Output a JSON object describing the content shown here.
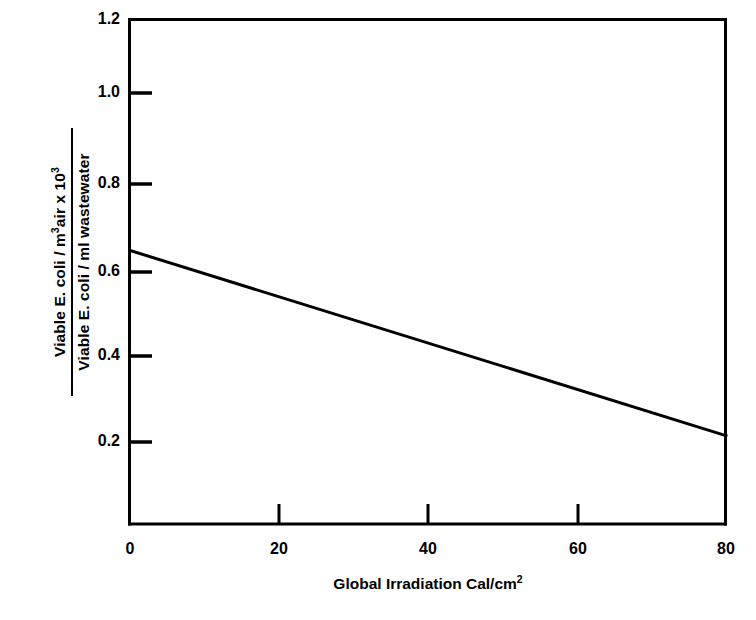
{
  "chart_data": {
    "type": "line",
    "title": "",
    "subtitle": "",
    "xlabel_parts": {
      "text": "Global Irradiation  Cal/cm",
      "exponent": "2"
    },
    "ylabel_parts": {
      "numerator_pre": "Viable E. coli / m",
      "numerator_sup1": "3",
      "numerator_mid": "air  x  10",
      "numerator_sup2": "3",
      "denominator": "Viable E. coli / ml wastewater"
    },
    "xlim": [
      0,
      80
    ],
    "ylim": [
      0.0,
      1.2
    ],
    "xticks": [
      0,
      20,
      40,
      60,
      80
    ],
    "xtick_labels": [
      "0",
      "20",
      "40",
      "60",
      "80"
    ],
    "yticks": [
      0.2,
      0.4,
      0.6,
      0.8,
      1.0,
      1.2
    ],
    "ytick_labels": [
      "0.2",
      "0.4",
      "0.6",
      "0.8",
      "1.0",
      "1.2"
    ],
    "grid": false,
    "legend": null,
    "frame": "box",
    "series": [
      {
        "name": "Viable E. coli ratio",
        "x": [
          0,
          80
        ],
        "values": [
          0.65,
          0.21
        ],
        "color": "#000000",
        "linewidth": 3
      }
    ],
    "annotations": []
  },
  "colors": {
    "background": "#ffffff",
    "axis": "#000000",
    "line": "#000000"
  }
}
